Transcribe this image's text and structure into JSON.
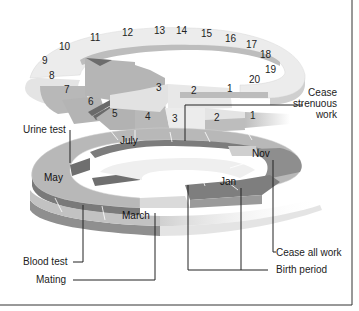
{
  "diagram": {
    "type": "spiral-timeline",
    "upper_spiral_numbers": [
      "1",
      "2",
      "3",
      "4",
      "5",
      "6",
      "7",
      "8",
      "9",
      "10",
      "11",
      "12",
      "13",
      "14",
      "15",
      "16",
      "17",
      "18",
      "19",
      "20"
    ],
    "lower_spiral_numbers": [
      "1",
      "2",
      "3"
    ],
    "outer_numbers": {
      "n11": "11",
      "n12": "12",
      "n13": "13",
      "n14": "14",
      "n15": "15",
      "n16": "16",
      "n17": "17",
      "n18": "18",
      "n19": "19",
      "n20": "20",
      "n10": "10",
      "n9": "9",
      "n8": "8",
      "n7": "7",
      "n6": "6",
      "n5": "5",
      "n4": "4",
      "n3_upper": "3",
      "n2_upper": "2",
      "n1_upper": "1",
      "n3_lower": "3",
      "n2_lower": "2",
      "n1_lower": "1"
    },
    "months": {
      "july": "July",
      "may": "May",
      "march": "March",
      "nov": "Nov",
      "jan": "Jan"
    },
    "annotations": {
      "cease_strenuous_1": "Cease",
      "cease_strenuous_2": "strenuous",
      "cease_strenuous_3": "work",
      "urine_test": "Urine test",
      "blood_test": "Blood test",
      "mating": "Mating",
      "cease_all_work": "Cease all work",
      "birth_period": "Birth period"
    },
    "colors": {
      "light_segment": "#e6e6e6",
      "mid_segment": "#b3b3b3",
      "dark_segment": "#8a8a8a",
      "darker_segment": "#6e6e6e",
      "edge": "#7a7a7a",
      "line": "#222222"
    }
  }
}
